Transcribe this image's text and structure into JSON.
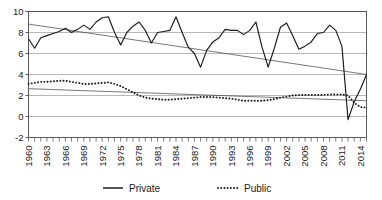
{
  "chart_data": {
    "type": "line",
    "title": "",
    "subtitle": "",
    "xlabel": "",
    "ylabel": "",
    "xlim": [
      1960,
      2015
    ],
    "ylim": [
      -2,
      10
    ],
    "yticks": [
      -2,
      0,
      2,
      4,
      6,
      8,
      10
    ],
    "ytick_labels": [
      "-2",
      "0",
      "2",
      "4",
      "6",
      "8",
      "10"
    ],
    "xticks": [
      1960,
      1963,
      1966,
      1969,
      1972,
      1975,
      1978,
      1981,
      1984,
      1987,
      1990,
      1993,
      1996,
      1999,
      2002,
      2005,
      2008,
      2011,
      2014
    ],
    "xtick_labels": [
      "1960",
      "1963",
      "1966",
      "1969",
      "1972",
      "1975",
      "1978",
      "1981",
      "1984",
      "1987",
      "1990",
      "1993",
      "1996",
      "1999",
      "2002",
      "2005",
      "2008",
      "2011",
      "2014"
    ],
    "minor_xticks_every": 1,
    "grid": "horizontal",
    "legend_position": "bottom",
    "legend": [
      {
        "name": "Private",
        "style": "solid",
        "color": "#1a1a1a"
      },
      {
        "name": "Public",
        "style": "dotted",
        "color": "#1a1a1a"
      }
    ],
    "x": [
      1960,
      1961,
      1962,
      1963,
      1964,
      1965,
      1966,
      1967,
      1968,
      1969,
      1970,
      1971,
      1972,
      1973,
      1974,
      1975,
      1976,
      1977,
      1978,
      1979,
      1980,
      1981,
      1982,
      1983,
      1984,
      1985,
      1986,
      1987,
      1988,
      1989,
      1990,
      1991,
      1992,
      1993,
      1994,
      1995,
      1996,
      1997,
      1998,
      1999,
      2000,
      2001,
      2002,
      2003,
      2004,
      2005,
      2006,
      2007,
      2008,
      2009,
      2010,
      2011,
      2012,
      2013,
      2014,
      2015
    ],
    "series": [
      {
        "name": "Private",
        "style": "solid",
        "color": "#1a1a1a",
        "values": [
          7.4,
          6.5,
          7.5,
          7.7,
          7.9,
          8.1,
          8.4,
          8.0,
          8.3,
          8.7,
          8.3,
          9.0,
          9.4,
          9.5,
          8.0,
          6.8,
          8.0,
          8.6,
          9.0,
          8.2,
          7.0,
          8.0,
          8.1,
          8.2,
          9.5,
          8.0,
          6.6,
          6.0,
          4.7,
          6.3,
          7.1,
          7.5,
          8.3,
          8.2,
          8.2,
          7.8,
          8.2,
          9.0,
          6.6,
          4.7,
          6.5,
          8.5,
          8.9,
          7.7,
          6.4,
          6.7,
          7.1,
          7.9,
          8.0,
          8.7,
          8.2,
          6.7,
          -0.3,
          1.4,
          2.6,
          4.0
        ]
      },
      {
        "name": "Public",
        "style": "dotted",
        "color": "#1a1a1a",
        "values": [
          3.1,
          3.2,
          3.3,
          3.3,
          3.35,
          3.4,
          3.4,
          3.3,
          3.2,
          3.1,
          3.1,
          3.15,
          3.2,
          3.25,
          3.1,
          2.9,
          2.6,
          2.3,
          2.0,
          1.8,
          1.7,
          1.65,
          1.6,
          1.6,
          1.65,
          1.7,
          1.75,
          1.8,
          1.85,
          1.85,
          1.85,
          1.8,
          1.75,
          1.7,
          1.6,
          1.5,
          1.5,
          1.5,
          1.5,
          1.55,
          1.65,
          1.8,
          1.9,
          2.0,
          2.05,
          2.05,
          2.05,
          2.05,
          2.05,
          2.1,
          2.1,
          2.1,
          2.0,
          1.3,
          0.9,
          0.85
        ]
      }
    ],
    "trendlines": [
      {
        "for": "Private",
        "x0": 1960,
        "y0": 8.8,
        "x1": 2015,
        "y1": 4.0
      },
      {
        "for": "Public",
        "x0": 1960,
        "y0": 2.65,
        "x1": 2015,
        "y1": 1.5
      }
    ],
    "axis_color": "#5a5a5a",
    "grid_color": "#b8b8b8",
    "background": "#ffffff"
  }
}
